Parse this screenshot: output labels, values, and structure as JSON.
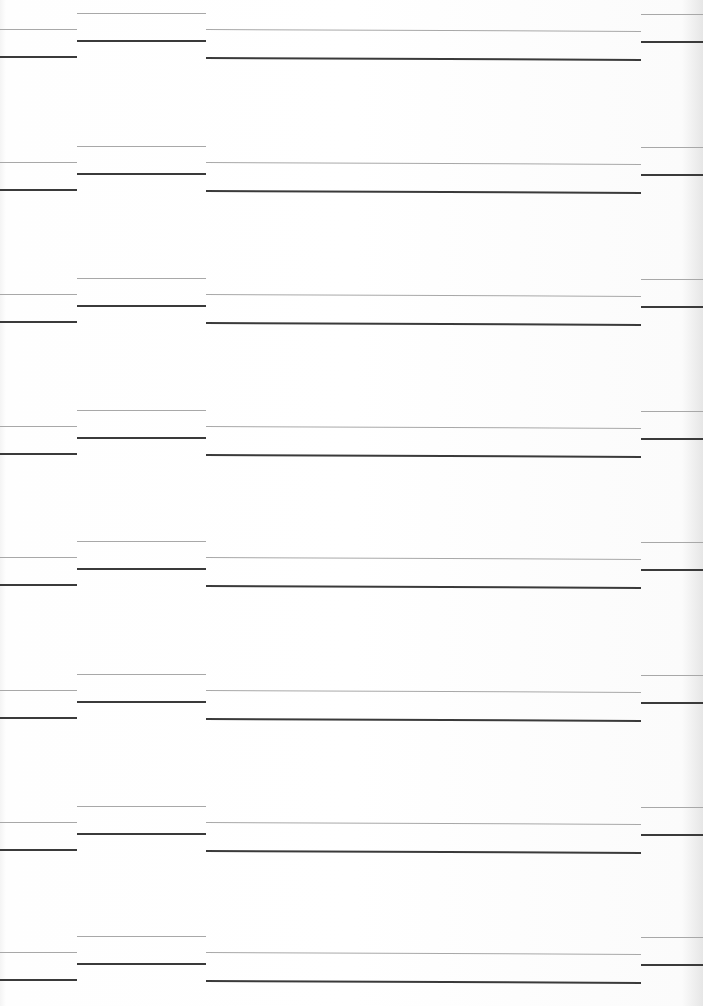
{
  "document": {
    "type": "ruled-form-page",
    "columns": [
      "A",
      "B",
      "C",
      "D"
    ],
    "band_count": 8,
    "band_offsets_y": [
      0,
      133,
      265,
      397,
      528,
      661,
      793,
      923
    ],
    "line_colors": {
      "light": "#a8a8a8",
      "dark": "#3a3a3a"
    }
  }
}
